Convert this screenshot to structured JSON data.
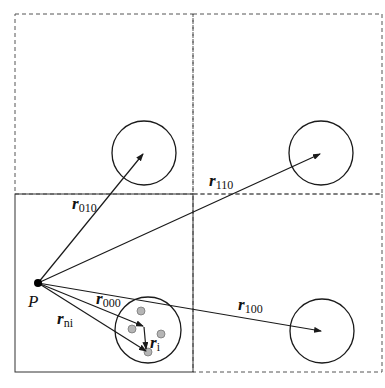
{
  "diagram": {
    "title": "",
    "point_label": "P",
    "cells": [
      {
        "id": "000",
        "position": "bottom-left",
        "border": "solid"
      },
      {
        "id": "010",
        "position": "top-left",
        "border": "dashed"
      },
      {
        "id": "110",
        "position": "top-right",
        "border": "dashed"
      },
      {
        "id": "100",
        "position": "bottom-right",
        "border": "dashed"
      }
    ],
    "vectors": [
      {
        "id": "r010",
        "base": "r",
        "sub": "010"
      },
      {
        "id": "r110",
        "base": "r",
        "sub": "110"
      },
      {
        "id": "r000",
        "base": "r",
        "sub": "000"
      },
      {
        "id": "r100",
        "base": "r",
        "sub": "100"
      },
      {
        "id": "rni",
        "base": "r",
        "sub": "ni"
      },
      {
        "id": "ri",
        "base": "r",
        "sub": "i"
      }
    ],
    "colors": {
      "line": "#1a1a1a",
      "dashed": "#555555",
      "particle": "#b0b0b0"
    }
  }
}
